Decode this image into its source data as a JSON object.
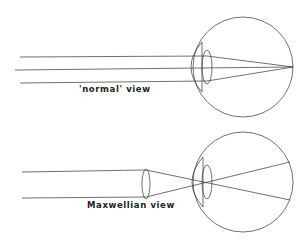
{
  "diagrams": [
    {
      "id": "normal",
      "label": "'normal' view"
    },
    {
      "id": "maxwellian",
      "label": "Maxwellian view"
    }
  ],
  "colors": {
    "line": "#333333",
    "background": "#ffffff"
  }
}
